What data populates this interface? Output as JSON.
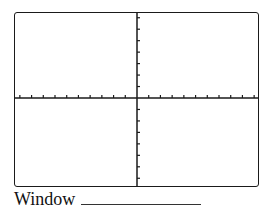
{
  "graph": {
    "description": "Blank coordinate grid (graphing calculator screen template)",
    "x_ticks_each_side": 10,
    "y_ticks_each_side": 7,
    "axis_color": "#1a1a1a",
    "frame_color": "#1a1a1a"
  },
  "footer": {
    "window_label": "Window"
  }
}
